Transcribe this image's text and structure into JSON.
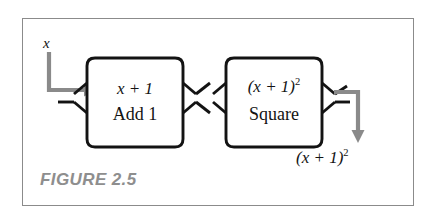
{
  "figure": {
    "caption": "FIGURE 2.5",
    "frame_color": "#8b8b8b",
    "background_color": "#ffffff",
    "box_stroke_color": "#131313",
    "arrow_color": "#8a8a8a",
    "text_color": "#131313",
    "caption_color": "#8e8e8e"
  },
  "input": {
    "label": "x"
  },
  "boxes": [
    {
      "name": "add-one",
      "output_expression": "x + 1",
      "output_expression_base": "x + 1",
      "operation_label": "Add 1"
    },
    {
      "name": "square",
      "output_expression": "(x + 1)",
      "output_expression_exponent": "2",
      "operation_label": "Square"
    }
  ],
  "output": {
    "expression_base": "(x + 1)",
    "expression_exponent": "2"
  },
  "icons": {
    "input_arrow": "arrow-down-right-icon",
    "output_arrow": "arrow-right-down-icon"
  }
}
